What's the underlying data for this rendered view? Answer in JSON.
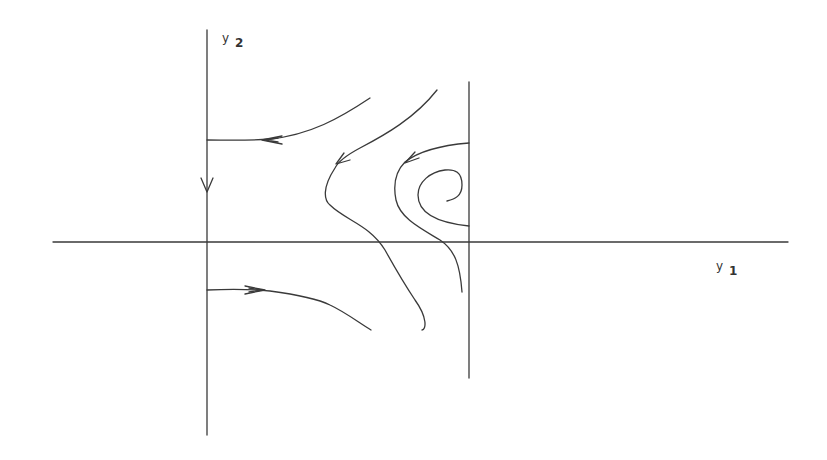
{
  "figure": {
    "type": "phase-portrait",
    "stroke_color": "#333333",
    "background": "#ffffff"
  },
  "axes": {
    "horizontal": {
      "label_symbol": "y",
      "label_subscript": "1"
    },
    "vertical": {
      "label_symbol": "y",
      "label_subscript": "2"
    }
  },
  "lines": {
    "vertical_boundary": "vertical line at right (positive y1 value)"
  },
  "trajectories": [
    {
      "id": "upper-left-arc",
      "direction": "leftward toward y2-axis",
      "arrow": "left"
    },
    {
      "id": "middle-hyperbola",
      "direction": "arrow on upper branch pointing down-left",
      "arrow": "down-left"
    },
    {
      "id": "inner-hyperbola",
      "direction": "arrow on upper branch pointing left",
      "arrow": "left"
    },
    {
      "id": "spiral",
      "direction": "spiral inside near vertical boundary",
      "arrow": "none"
    },
    {
      "id": "lower-left-arc",
      "direction": "rightward away from y2-axis",
      "arrow": "right"
    },
    {
      "id": "y2-axis-flow",
      "direction": "downward along y2-axis",
      "arrow": "down"
    }
  ]
}
